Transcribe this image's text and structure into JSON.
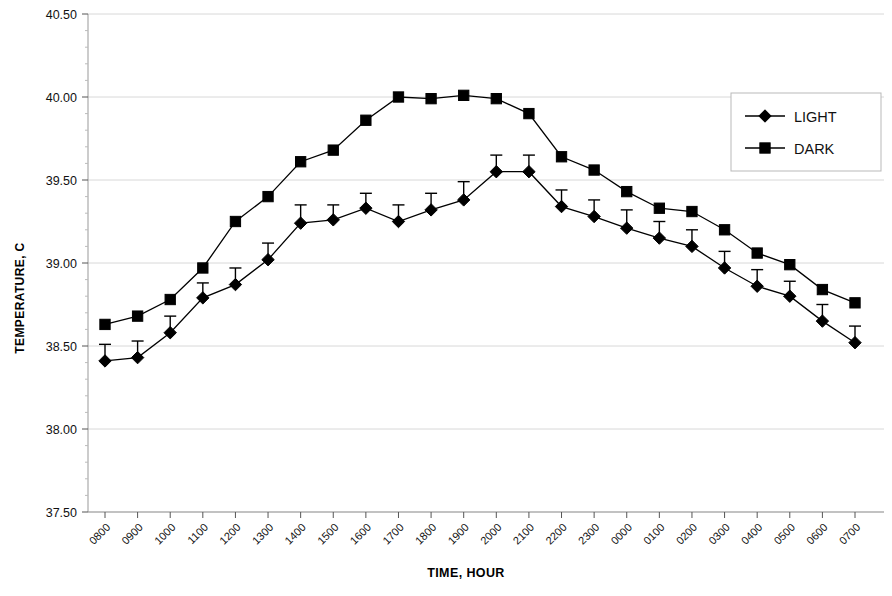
{
  "chart_data": {
    "type": "line",
    "title": "",
    "xlabel": "TIME, HOUR",
    "ylabel": "TEMPERATURE, C",
    "ylim": [
      37.5,
      40.5
    ],
    "yticks": [
      "37.50",
      "38.00",
      "38.50",
      "39.00",
      "39.50",
      "40.00",
      "40.50"
    ],
    "ytick_values": [
      37.5,
      38.0,
      38.5,
      39.0,
      39.5,
      40.0,
      40.5
    ],
    "grid": "horizontal-faint",
    "legend_position": "top-right",
    "categories": [
      "0800",
      "0900",
      "1000",
      "1100",
      "1200",
      "1300",
      "1400",
      "1500",
      "1600",
      "1700",
      "1800",
      "1900",
      "2000",
      "2100",
      "2200",
      "2300",
      "0000",
      "0100",
      "0200",
      "0300",
      "0400",
      "0500",
      "0600",
      "0700"
    ],
    "series": [
      {
        "name": "LIGHT",
        "marker": "diamond",
        "color": "#000000",
        "values": [
          38.41,
          38.43,
          38.58,
          38.79,
          38.87,
          39.02,
          39.24,
          39.26,
          39.33,
          39.25,
          39.32,
          39.38,
          39.55,
          39.55,
          39.34,
          39.28,
          39.21,
          39.15,
          39.1,
          38.97,
          38.86,
          38.8,
          38.65,
          38.52
        ],
        "errors_up": [
          0.1,
          0.1,
          0.1,
          0.09,
          0.1,
          0.1,
          0.11,
          0.09,
          0.09,
          0.1,
          0.1,
          0.11,
          0.1,
          0.1,
          0.1,
          0.1,
          0.11,
          0.1,
          0.1,
          0.1,
          0.1,
          0.09,
          0.1,
          0.1
        ]
      },
      {
        "name": "DARK",
        "marker": "square",
        "color": "#000000",
        "values": [
          38.63,
          38.68,
          38.78,
          38.97,
          39.25,
          39.4,
          39.61,
          39.68,
          39.86,
          40.0,
          39.99,
          40.01,
          39.99,
          39.9,
          39.64,
          39.56,
          39.43,
          39.33,
          39.31,
          39.2,
          39.06,
          38.99,
          38.84,
          38.76
        ],
        "errors_up": [
          0,
          0,
          0,
          0,
          0,
          0,
          0,
          0,
          0,
          0,
          0,
          0,
          0,
          0,
          0,
          0,
          0,
          0,
          0,
          0,
          0,
          0,
          0,
          0
        ]
      }
    ],
    "legend": [
      {
        "label": "LIGHT",
        "marker": "diamond"
      },
      {
        "label": "DARK",
        "marker": "square"
      }
    ]
  }
}
